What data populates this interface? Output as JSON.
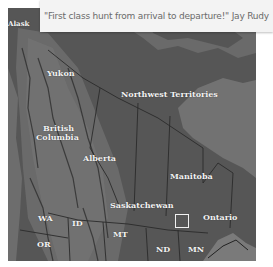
{
  "quote": {
    "text": "\"First class hunt from arrival to departure!\" Jay Rudy"
  },
  "map": {
    "labels": {
      "alaska": "Alask",
      "yukon": "Yukon",
      "northwest_territories": "Northwest  Territories",
      "british_columbia_line1": "British",
      "british_columbia_line2": "Columbia",
      "alberta": "Alberta",
      "manitoba": "Manitoba",
      "saskatchewan": "Saskatchewan",
      "ontario": "Ontario",
      "wa": "WA",
      "id": "ID",
      "mt": "MT",
      "or": "OR",
      "nd": "ND",
      "mn": "MN"
    },
    "colors": {
      "land": "#5a5a5a",
      "water": "#6e6e6e",
      "mountains": "#7a7a7a",
      "borders": "#2a2a2a",
      "label": "#f2f2f2",
      "highlight": "#f0f0f0"
    }
  }
}
